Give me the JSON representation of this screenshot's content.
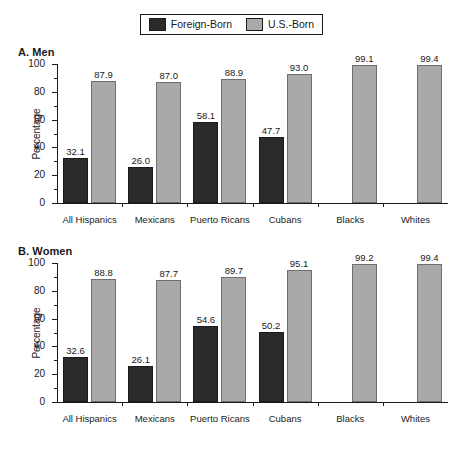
{
  "legend": {
    "entries": [
      {
        "label": "Foreign-Born",
        "swatch": "dark-square-icon",
        "color": "#2b2b2b"
      },
      {
        "label": "U.S.-Born",
        "swatch": "light-square-icon",
        "color": "#a9a9a9"
      }
    ]
  },
  "chart_data": [
    {
      "type": "bar",
      "title": "A. Men",
      "xlabel": "",
      "ylabel": "Percentage",
      "ylim": [
        0,
        100
      ],
      "yticks": [
        0,
        20,
        40,
        60,
        80,
        100
      ],
      "ytick_labels": [
        "0",
        "20",
        "40",
        "60",
        "80",
        "100"
      ],
      "minor_yticks": [
        10,
        30,
        50,
        70,
        90
      ],
      "grid": false,
      "legend_position": "top-center",
      "categories": [
        "All Hispanics",
        "Mexicans",
        "Puerto Ricans",
        "Cubans",
        "Blacks",
        "Whites"
      ],
      "series": [
        {
          "name": "Foreign-Born",
          "color": "#2b2b2b",
          "values": [
            32.1,
            26.0,
            58.1,
            47.7,
            null,
            null
          ],
          "labels": [
            "32.1",
            "26.0",
            "58.1",
            "47.7",
            "",
            ""
          ]
        },
        {
          "name": "U.S.-Born",
          "color": "#a9a9a9",
          "values": [
            87.9,
            87.0,
            88.9,
            93.0,
            99.1,
            99.4
          ],
          "labels": [
            "87.9",
            "87.0",
            "88.9",
            "93.0",
            "99.1",
            "99.4"
          ]
        }
      ]
    },
    {
      "type": "bar",
      "title": "B. Women",
      "xlabel": "",
      "ylabel": "Percentage",
      "ylim": [
        0,
        100
      ],
      "yticks": [
        0,
        20,
        40,
        60,
        80,
        100
      ],
      "ytick_labels": [
        "0",
        "20",
        "40",
        "60",
        "80",
        "100"
      ],
      "minor_yticks": [
        10,
        30,
        50,
        70,
        90
      ],
      "grid": false,
      "legend_position": "top-center",
      "categories": [
        "All Hispanics",
        "Mexicans",
        "Puerto Ricans",
        "Cubans",
        "Blacks",
        "Whites"
      ],
      "series": [
        {
          "name": "Foreign-Born",
          "color": "#2b2b2b",
          "values": [
            32.6,
            26.1,
            54.6,
            50.2,
            null,
            null
          ],
          "labels": [
            "32.6",
            "26.1",
            "54.6",
            "50.2",
            "",
            ""
          ]
        },
        {
          "name": "U.S.-Born",
          "color": "#a9a9a9",
          "values": [
            88.8,
            87.7,
            89.7,
            95.1,
            99.2,
            99.4
          ],
          "labels": [
            "88.8",
            "87.7",
            "89.7",
            "95.1",
            "99.2",
            "99.4"
          ]
        }
      ]
    }
  ]
}
